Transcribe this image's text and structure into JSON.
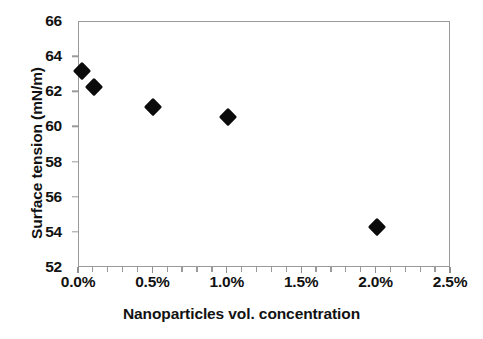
{
  "chart_data": {
    "type": "scatter",
    "title": "",
    "xlabel": "Nanoparticles vol. concentration",
    "ylabel": "Surface tension (mN/m)",
    "xlim": [
      0.0,
      2.5
    ],
    "ylim": [
      52,
      66
    ],
    "grid": false,
    "legend": null,
    "marker": "filled-diamond",
    "marker_color": "#0b0b0b",
    "x_tick_labels": [
      "0.0%",
      "0.5%",
      "1.0%",
      "1.5%",
      "2.0%",
      "2.5%"
    ],
    "x_tick_values": [
      0.0,
      0.5,
      1.0,
      1.5,
      2.0,
      2.5
    ],
    "x_minor_tick_step": 0.1,
    "y_tick_labels": [
      "66",
      "64",
      "62",
      "60",
      "58",
      "56",
      "54",
      "52"
    ],
    "y_tick_values": [
      66,
      64,
      62,
      60,
      58,
      56,
      54,
      52
    ],
    "series": [
      {
        "name": "Surface tension",
        "x": [
          0.02,
          0.1,
          0.5,
          1.0,
          2.0
        ],
        "y": [
          63.2,
          62.3,
          61.15,
          60.6,
          54.35
        ]
      }
    ],
    "points": [
      {
        "x": 0.02,
        "y": 63.2,
        "label": "0.02% / 63.2 mN/m"
      },
      {
        "x": 0.1,
        "y": 62.3,
        "label": "0.1% / 62.3 mN/m"
      },
      {
        "x": 0.5,
        "y": 61.15,
        "label": "0.5% / 61.15 mN/m"
      },
      {
        "x": 1.0,
        "y": 60.6,
        "label": "1.0% / 60.6 mN/m"
      },
      {
        "x": 2.0,
        "y": 54.35,
        "label": "2.0% / 54.35 mN/m"
      }
    ]
  },
  "colors": {
    "background": "#ffffff",
    "axis_line": "#9a9a9a",
    "text": "#121212",
    "marker": "#0b0b0b"
  }
}
